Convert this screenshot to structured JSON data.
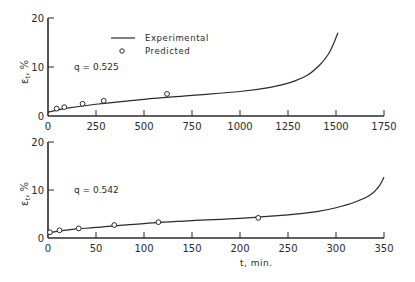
{
  "chart_data": [
    {
      "type": "line",
      "panel": "top",
      "xlabel": "",
      "ylabel": "ε_t, %",
      "xlim": [
        0,
        1750
      ],
      "ylim": [
        0,
        20
      ],
      "x_ticks": [
        0,
        250,
        500,
        750,
        1000,
        1250,
        1500,
        1750
      ],
      "y_ticks": [
        0,
        10,
        20
      ],
      "grid": false,
      "annotation": "q = 0.525",
      "legend": {
        "position": "upper-center",
        "entries": [
          "Experimental",
          "Predicted"
        ]
      },
      "series": [
        {
          "name": "Experimental",
          "style": "line",
          "x": [
            0,
            100,
            250,
            500,
            750,
            1000,
            1150,
            1260,
            1350,
            1415,
            1460,
            1490,
            1510
          ],
          "y": [
            0.8,
            1.6,
            2.4,
            3.4,
            4.2,
            5.0,
            5.8,
            6.8,
            8.3,
            10.4,
            12.6,
            15.0,
            17.0
          ]
        },
        {
          "name": "Predicted",
          "style": "markers",
          "x": [
            45,
            85,
            180,
            290,
            620
          ],
          "y": [
            1.5,
            1.8,
            2.5,
            3.1,
            4.5
          ]
        }
      ]
    },
    {
      "type": "line",
      "panel": "bottom",
      "xlabel": "t, min.",
      "ylabel": "ε_t, %",
      "xlim": [
        0,
        350
      ],
      "ylim": [
        0,
        20
      ],
      "x_ticks": [
        0,
        50,
        100,
        150,
        200,
        250,
        300,
        350
      ],
      "y_ticks": [
        0,
        10,
        20
      ],
      "grid": false,
      "annotation": "q = 0.542",
      "series": [
        {
          "name": "Experimental",
          "style": "line",
          "x": [
            0,
            25,
            50,
            100,
            150,
            200,
            250,
            280,
            300,
            320,
            336,
            345,
            350
          ],
          "y": [
            1.1,
            1.8,
            2.2,
            3.0,
            3.6,
            4.1,
            4.8,
            5.5,
            6.3,
            7.5,
            9.0,
            10.8,
            12.7
          ]
        },
        {
          "name": "Predicted",
          "style": "markers",
          "x": [
            2,
            12,
            32,
            69,
            115,
            219
          ],
          "y": [
            1.2,
            1.6,
            2.0,
            2.7,
            3.3,
            4.2
          ]
        }
      ]
    }
  ],
  "labels": {
    "top_annotation": "q = 0.525",
    "bottom_annotation": "q = 0.542",
    "legend_experimental": "Experimental",
    "legend_predicted": "Predicted",
    "ylabel_main": "ε",
    "ylabel_sub": "t",
    "ylabel_unit": ", %",
    "xlabel": "t, min."
  },
  "colors": {
    "ink": "#2a2a2a",
    "background": "#ffffff"
  }
}
